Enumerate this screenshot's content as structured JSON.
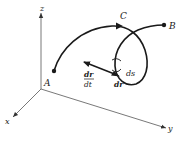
{
  "diagram": {
    "axes": {
      "x_label": "x",
      "y_label": "y",
      "z_label": "z"
    },
    "points": {
      "A": "A",
      "B": "B",
      "C": "C"
    },
    "vector_labels": {
      "tangent_num": "dr",
      "tangent_den": "dt",
      "displacement": "dr",
      "arc_length": "ds"
    },
    "colors": {
      "ink": "#1a1a1a",
      "axis": "#555555",
      "background": "#ffffff"
    }
  }
}
